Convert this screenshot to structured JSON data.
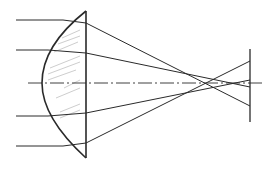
{
  "diagram": {
    "title": "Spherical aberration of a plano-convex lens",
    "colors": {
      "line": "#2a2a2a",
      "hatch": "#b8b8b8",
      "background": "#ffffff"
    },
    "optical_axis": {
      "x1": 28,
      "y": 83,
      "x2": 263,
      "style": "dash-dot"
    },
    "lens": {
      "type": "plano-convex",
      "flat_face_x": 86,
      "top_tip": [
        86,
        11
      ],
      "bottom_tip": [
        86,
        158
      ],
      "apex": [
        42,
        83
      ]
    },
    "screen": {
      "x": 250,
      "y1": 49,
      "y2": 122
    },
    "rays": [
      {
        "name": "marginal-top",
        "incident_y": 20,
        "start_x": 16,
        "lens_hit": [
          63,
          20
        ],
        "exit": [
          86,
          23
        ],
        "crossing": [
          204,
          83
        ],
        "screen_hit": [
          250,
          107
        ]
      },
      {
        "name": "paraxial-top",
        "incident_y": 50,
        "start_x": 16,
        "lens_hit": [
          48,
          50
        ],
        "exit": [
          86,
          53
        ],
        "crossing": [
          240,
          83
        ],
        "screen_hit": [
          250,
          87
        ]
      },
      {
        "name": "paraxial-bottom",
        "incident_y": 116,
        "start_x": 16,
        "lens_hit": [
          48,
          116
        ],
        "exit": [
          86,
          113
        ],
        "crossing": [
          240,
          83
        ],
        "screen_hit": [
          250,
          80
        ]
      },
      {
        "name": "marginal-bottom",
        "incident_y": 146,
        "start_x": 16,
        "lens_hit": [
          63,
          146
        ],
        "exit": [
          86,
          143
        ],
        "crossing": [
          204,
          83
        ],
        "screen_hit": [
          250,
          61
        ]
      }
    ]
  }
}
